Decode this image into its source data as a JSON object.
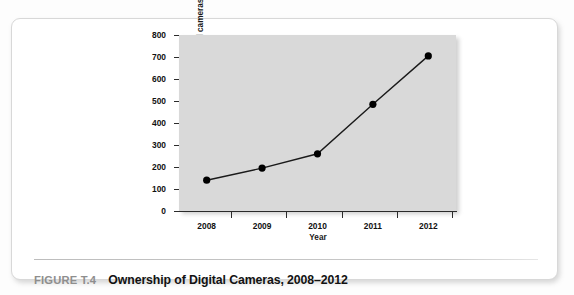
{
  "figure": {
    "caption_label": "FIGURE T.4",
    "caption_title": "Ownership of Digital Cameras, 2008–2012"
  },
  "chart_data": {
    "type": "line",
    "title": "Ownership of Digital Cameras, 2008–2012",
    "xlabel": "Year",
    "ylabel": "Unit sales of digital cameras (millions)",
    "ylabel_line1": "Unit sales of digital cameras",
    "ylabel_line2": "(millions)",
    "categories": [
      "2008",
      "2009",
      "2010",
      "2011",
      "2012"
    ],
    "x": [
      2008,
      2009,
      2010,
      2011,
      2012
    ],
    "values": [
      140,
      195,
      260,
      485,
      705
    ],
    "ylim": [
      0,
      800
    ],
    "yticks": [
      0,
      100,
      200,
      300,
      400,
      500,
      600,
      700,
      800
    ],
    "ytick_labels": [
      "0",
      "100",
      "200",
      "300",
      "400",
      "500",
      "600",
      "700",
      "800"
    ],
    "xtick_labels": [
      "2008",
      "2009",
      "2010",
      "2011",
      "2012"
    ],
    "grid": false,
    "legend": "none",
    "marker": "filled-circle",
    "series": [
      {
        "name": "Unit sales of digital cameras (millions)",
        "values": [
          140,
          195,
          260,
          485,
          705
        ]
      }
    ],
    "colors": {
      "plot_background": "#d9d9d9",
      "line": "#1a1a1a",
      "marker": "#000000",
      "axis": "#2b2b2b",
      "text": "#111111"
    }
  }
}
